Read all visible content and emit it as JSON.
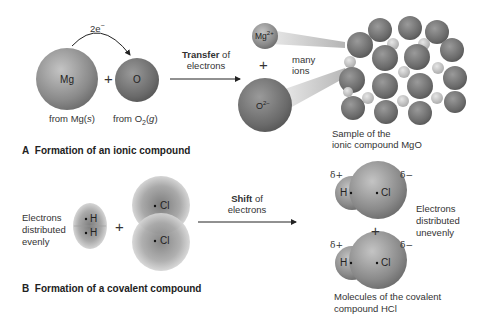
{
  "panelA": {
    "caption_letter": "A",
    "caption": "Formation of an ionic compound",
    "electron_label": "2e",
    "electron_sup": "−",
    "atom_mg": "Mg",
    "atom_o": "O",
    "plus": "+",
    "from_mg_prefix": "from Mg(",
    "from_mg_state": "s",
    "from_mg_suffix": ")",
    "from_o_prefix": "from O",
    "from_o_sub": "2",
    "from_o_mid": "(",
    "from_o_state": "g",
    "from_o_suffix": ")",
    "transfer_bold": "Transfer",
    "transfer_rest": " of",
    "transfer_line2": "electrons",
    "ion_mg": "Mg",
    "ion_mg_charge": "2+",
    "ion_o": "O",
    "ion_o_charge": "2−",
    "many_ions_1": "many",
    "many_ions_2": "ions",
    "sample_1": "Sample of the",
    "sample_2": "ionic compound MgO"
  },
  "panelB": {
    "caption_letter": "B",
    "caption": "Formation of a covalent compound",
    "even_1": "Electrons",
    "even_2": "distributed",
    "even_3": "evenly",
    "h": "H",
    "cl": "Cl",
    "plus": "+",
    "shift_bold": "Shift",
    "shift_rest": " of",
    "shift_line2": "electrons",
    "delta_plus": "δ+",
    "delta_minus": "δ−",
    "uneven_1": "Electrons",
    "uneven_2": "distributed",
    "uneven_3": "unevenly",
    "molecules_1": "Molecules of the covalent",
    "molecules_2": "compound HCl"
  },
  "colors": {
    "sphere_light": "#bdbdbd",
    "sphere_dark": "#6e6e6e",
    "small_ion": "#d6d6d6",
    "beam": "#d9d9d9",
    "text": "#333333"
  }
}
